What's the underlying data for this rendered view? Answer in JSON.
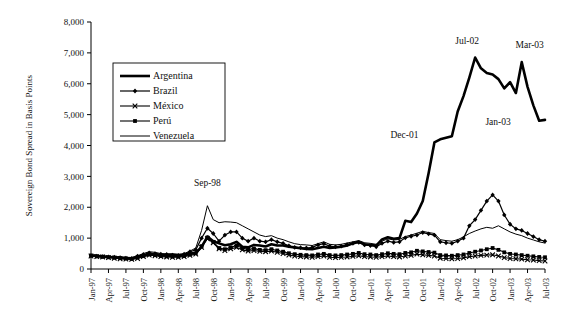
{
  "chart_data": {
    "type": "line",
    "title": "",
    "xlabel": "",
    "ylabel": "Sovereign Bond Spread in Basis Points",
    "ylim": [
      0,
      8000
    ],
    "yticks": [
      0,
      1000,
      2000,
      3000,
      4000,
      5000,
      6000,
      7000,
      8000
    ],
    "ytick_labels": [
      "0",
      "1,000",
      "2,000",
      "3,000",
      "4,000",
      "5,000",
      "6,000",
      "7,000",
      "8,000"
    ],
    "grid": false,
    "legend_position": "upper-left-inside",
    "x_start": "Jan-97",
    "x_end": "Jul-03",
    "xtick_labels": [
      "Jan-97",
      "Apr-97",
      "Jul-97",
      "Oct-97",
      "Jan-98",
      "Apr-98",
      "Jul-98",
      "Oct-98",
      "Jan-99",
      "Apr-99",
      "Jul-99",
      "Oct-99",
      "Jan-00",
      "Apr-00",
      "Jul-00",
      "Oct-00",
      "Jan-01",
      "Apr-01",
      "Jul-01",
      "Oct-01",
      "Jan-02",
      "Apr-02",
      "Jul-02",
      "Oct-02",
      "Jan-03",
      "Apr-03",
      "Jul-03"
    ],
    "x_months": [
      "Jan-97",
      "Feb-97",
      "Mar-97",
      "Apr-97",
      "May-97",
      "Jun-97",
      "Jul-97",
      "Aug-97",
      "Sep-97",
      "Oct-97",
      "Nov-97",
      "Dec-97",
      "Jan-98",
      "Feb-98",
      "Mar-98",
      "Apr-98",
      "May-98",
      "Jun-98",
      "Jul-98",
      "Aug-98",
      "Sep-98",
      "Oct-98",
      "Nov-98",
      "Dec-98",
      "Jan-99",
      "Feb-99",
      "Mar-99",
      "Apr-99",
      "May-99",
      "Jun-99",
      "Jul-99",
      "Aug-99",
      "Sep-99",
      "Oct-99",
      "Nov-99",
      "Dec-99",
      "Jan-00",
      "Feb-00",
      "Mar-00",
      "Apr-00",
      "May-00",
      "Jun-00",
      "Jul-00",
      "Aug-00",
      "Sep-00",
      "Oct-00",
      "Nov-00",
      "Dec-00",
      "Jan-01",
      "Feb-01",
      "Mar-01",
      "Apr-01",
      "May-01",
      "Jun-01",
      "Jul-01",
      "Aug-01",
      "Sep-01",
      "Oct-01",
      "Nov-01",
      "Dec-01",
      "Jan-02",
      "Feb-02",
      "Mar-02",
      "Apr-02",
      "May-02",
      "Jun-02",
      "Jul-02",
      "Aug-02",
      "Sep-02",
      "Oct-02",
      "Nov-02",
      "Dec-02",
      "Jan-03",
      "Feb-03",
      "Mar-03",
      "Apr-03",
      "May-03",
      "Jun-03",
      "Jul-03"
    ],
    "series": [
      {
        "name": "Argentina",
        "marker": "none",
        "line_width": 2.6,
        "values": [
          440,
          420,
          400,
          390,
          380,
          360,
          350,
          340,
          400,
          440,
          470,
          480,
          440,
          460,
          470,
          450,
          460,
          500,
          520,
          720,
          1050,
          900,
          830,
          770,
          800,
          880,
          720,
          700,
          780,
          760,
          730,
          800,
          760,
          760,
          720,
          700,
          670,
          650,
          640,
          680,
          720,
          680,
          700,
          720,
          760,
          830,
          880,
          800,
          780,
          760,
          960,
          1030,
          980,
          1000,
          1560,
          1520,
          1800,
          2200,
          3100,
          4100,
          4200,
          4250,
          4300,
          5100,
          5600,
          6200,
          6850,
          6500,
          6350,
          6300,
          6150,
          5850,
          6050,
          5700,
          6700,
          5900,
          5300,
          4800,
          4830
        ]
      },
      {
        "name": "Brazil",
        "marker": "diamond",
        "line_width": 1.2,
        "values": [
          440,
          420,
          400,
          390,
          380,
          370,
          350,
          340,
          420,
          470,
          520,
          500,
          480,
          470,
          450,
          440,
          480,
          560,
          620,
          1000,
          1320,
          1150,
          900,
          1100,
          1200,
          1200,
          1000,
          900,
          1000,
          900,
          880,
          950,
          880,
          830,
          750,
          700,
          690,
          680,
          700,
          780,
          820,
          740,
          720,
          740,
          790,
          830,
          860,
          780,
          760,
          720,
          830,
          900,
          860,
          880,
          1010,
          1060,
          1100,
          1180,
          1140,
          1100,
          880,
          850,
          830,
          900,
          1000,
          1400,
          1600,
          1900,
          2200,
          2400,
          2200,
          1750,
          1450,
          1300,
          1250,
          1150,
          1050,
          950,
          900
        ]
      },
      {
        "name": "México",
        "marker": "x",
        "line_width": 1.1,
        "values": [
          420,
          400,
          390,
          370,
          350,
          330,
          320,
          310,
          340,
          400,
          450,
          430,
          400,
          390,
          380,
          380,
          400,
          440,
          480,
          700,
          980,
          850,
          650,
          600,
          650,
          700,
          620,
          580,
          600,
          570,
          560,
          580,
          540,
          500,
          450,
          420,
          400,
          390,
          380,
          400,
          420,
          380,
          370,
          380,
          390,
          410,
          430,
          400,
          390,
          380,
          400,
          420,
          400,
          390,
          420,
          440,
          480,
          460,
          440,
          420,
          350,
          340,
          330,
          340,
          360,
          400,
          420,
          440,
          450,
          460,
          420,
          370,
          340,
          330,
          320,
          300,
          290,
          270,
          260
        ]
      },
      {
        "name": "Perú",
        "marker": "square",
        "line_width": 1.1,
        "values": [
          430,
          410,
          400,
          380,
          370,
          350,
          340,
          330,
          370,
          420,
          470,
          450,
          420,
          410,
          400,
          400,
          420,
          470,
          510,
          740,
          1020,
          880,
          680,
          640,
          700,
          760,
          680,
          630,
          660,
          620,
          610,
          640,
          600,
          560,
          510,
          480,
          460,
          450,
          440,
          470,
          490,
          450,
          440,
          450,
          470,
          490,
          520,
          480,
          470,
          450,
          480,
          510,
          490,
          480,
          520,
          540,
          590,
          570,
          550,
          530,
          450,
          440,
          430,
          450,
          470,
          520,
          560,
          600,
          640,
          680,
          620,
          540,
          490,
          470,
          450,
          430,
          410,
          390,
          380
        ]
      },
      {
        "name": "Venezuela",
        "marker": "none",
        "line_width": 1.0,
        "values": [
          460,
          440,
          430,
          410,
          400,
          390,
          380,
          370,
          430,
          500,
          560,
          540,
          500,
          490,
          480,
          470,
          500,
          580,
          680,
          1250,
          2050,
          1600,
          1500,
          1530,
          1520,
          1500,
          1400,
          1300,
          1200,
          1100,
          1050,
          1080,
          1000,
          950,
          880,
          820,
          790,
          780,
          760,
          820,
          880,
          800,
          780,
          800,
          840,
          880,
          920,
          850,
          830,
          800,
          900,
          980,
          940,
          960,
          1050,
          1100,
          1160,
          1220,
          1180,
          1150,
          950,
          920,
          900,
          950,
          1040,
          1150,
          1230,
          1300,
          1350,
          1320,
          1400,
          1300,
          1200,
          1130,
          1080,
          1000,
          940,
          880,
          840
        ]
      }
    ],
    "annotations": [
      {
        "label": "Sep-98",
        "x_month": "Sep-98",
        "value": 2050,
        "dx": 0,
        "dy": -20
      },
      {
        "label": "Dec-01",
        "x_month": "Dec-01",
        "value": 4100,
        "dx": -30,
        "dy": -4
      },
      {
        "label": "Jul-02",
        "x_month": "Jul-02",
        "value": 6850,
        "dx": -8,
        "dy": -14
      },
      {
        "label": "Jan-03",
        "x_month": "Jan-03",
        "value": 5700,
        "dx": -12,
        "dy": 32
      },
      {
        "label": "Mar-03",
        "x_month": "Mar-03",
        "value": 6700,
        "dx": 8,
        "dy": -14
      }
    ]
  },
  "legend": {
    "entries": [
      {
        "label": "Argentina"
      },
      {
        "label": "Brazil"
      },
      {
        "label": "México"
      },
      {
        "label": "Perú"
      },
      {
        "label": "Venezuela"
      }
    ]
  }
}
